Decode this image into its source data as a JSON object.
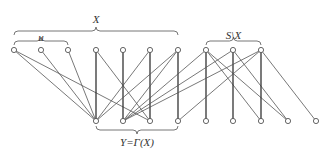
{
  "diagram": {
    "type": "bipartite-graph",
    "labels": {
      "X": "X",
      "u": "u",
      "S_minus_X": "S\\X",
      "Y": "Y=Γ(X)"
    },
    "top_nodes": [
      {
        "id": "T0",
        "x": 14,
        "y": 50
      },
      {
        "id": "T1",
        "x": 41,
        "y": 50
      },
      {
        "id": "T2",
        "x": 68,
        "y": 50
      },
      {
        "id": "T3",
        "x": 96,
        "y": 50
      },
      {
        "id": "T4",
        "x": 123,
        "y": 50
      },
      {
        "id": "T5",
        "x": 150,
        "y": 50
      },
      {
        "id": "T6",
        "x": 178,
        "y": 50
      },
      {
        "id": "T7",
        "x": 206,
        "y": 50
      },
      {
        "id": "T8",
        "x": 233,
        "y": 50
      },
      {
        "id": "T9",
        "x": 261,
        "y": 50
      }
    ],
    "bottom_nodes": [
      {
        "id": "B0",
        "x": 96,
        "y": 121
      },
      {
        "id": "B1",
        "x": 123,
        "y": 121
      },
      {
        "id": "B2",
        "x": 150,
        "y": 121
      },
      {
        "id": "B3",
        "x": 178,
        "y": 121
      },
      {
        "id": "B4",
        "x": 206,
        "y": 121
      },
      {
        "id": "B5",
        "x": 233,
        "y": 121
      },
      {
        "id": "B6",
        "x": 261,
        "y": 121
      },
      {
        "id": "B7",
        "x": 288,
        "y": 121
      },
      {
        "id": "B8",
        "x": 316,
        "y": 121
      }
    ],
    "edges": [
      [
        "T0",
        "B0"
      ],
      [
        "T0",
        "B2"
      ],
      [
        "T1",
        "B0"
      ],
      [
        "T2",
        "B0"
      ],
      [
        "T3",
        "B0"
      ],
      [
        "T3",
        "B2"
      ],
      [
        "T4",
        "B1"
      ],
      [
        "T5",
        "B2"
      ],
      [
        "T5",
        "B0"
      ],
      [
        "T6",
        "B3"
      ],
      [
        "T6",
        "B0"
      ],
      [
        "T6",
        "B1"
      ],
      [
        "T7",
        "B4"
      ],
      [
        "T7",
        "B1"
      ],
      [
        "T7",
        "B6"
      ],
      [
        "T7",
        "B7"
      ],
      [
        "T8",
        "B5"
      ],
      [
        "T8",
        "B1"
      ],
      [
        "T8",
        "B7"
      ],
      [
        "T9",
        "B6"
      ],
      [
        "T9",
        "B1"
      ],
      [
        "T9",
        "B3"
      ],
      [
        "T9",
        "B8"
      ]
    ],
    "vertical_edges": [
      [
        "T3",
        "B0"
      ],
      [
        "T4",
        "B1"
      ],
      [
        "T5",
        "B2"
      ],
      [
        "T6",
        "B3"
      ],
      [
        "T7",
        "B4"
      ],
      [
        "T8",
        "B5"
      ],
      [
        "T9",
        "B6"
      ]
    ],
    "braces": [
      {
        "name": "X",
        "x1": 14,
        "x2": 178,
        "y": 35,
        "dir": "up",
        "label_y": 13
      },
      {
        "name": "u",
        "x1": 14,
        "x2": 68,
        "y": 45,
        "dir": "up",
        "label_y": 31
      },
      {
        "name": "S_minus_X",
        "x1": 206,
        "x2": 261,
        "y": 45,
        "dir": "up",
        "label_y": 29
      },
      {
        "name": "Y",
        "x1": 96,
        "x2": 178,
        "y": 126,
        "dir": "down",
        "label_y": 136
      }
    ]
  }
}
